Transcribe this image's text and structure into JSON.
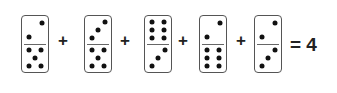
{
  "puzzle": {
    "dominoes": [
      {
        "top": 2,
        "bottom": 5
      },
      {
        "top": 3,
        "bottom": 5
      },
      {
        "top": 6,
        "bottom": 3
      },
      {
        "top": 2,
        "bottom": 6
      },
      {
        "top": 2,
        "bottom": 3
      }
    ],
    "operators": [
      "+",
      "+",
      "+",
      "+"
    ],
    "equals": "=",
    "result": "4",
    "result_text": "= 4"
  }
}
